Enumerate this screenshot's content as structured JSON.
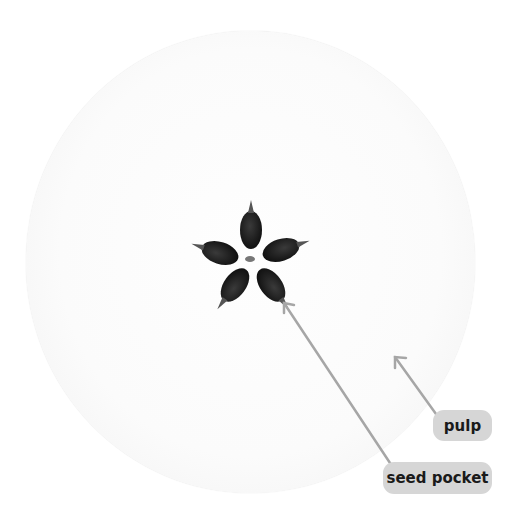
{
  "diagram": {
    "labels": [
      {
        "id": "pulp",
        "text": "pulp"
      },
      {
        "id": "seed_pocket",
        "text": "seed pocket"
      }
    ],
    "seed_count": 5,
    "colors": {
      "background": "#ffffff",
      "flesh": "#fbfbfb",
      "seed": "#1c1c1c",
      "pill": "#d6d6d6",
      "pill_text": "#1a1a1a",
      "arrow": "#a6a6a6"
    }
  }
}
